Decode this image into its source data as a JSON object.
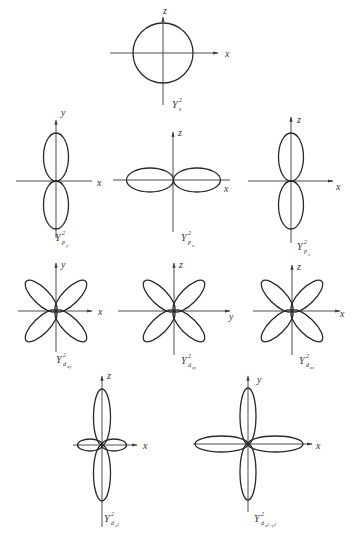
{
  "figure": {
    "panels": [
      {
        "id": "s",
        "axis_h": "x",
        "axis_v": "z",
        "label_main": "Y",
        "label_sup": "2",
        "label_sub": "s"
      },
      {
        "id": "py",
        "axis_h": "x",
        "axis_v": "y",
        "label_main": "Y",
        "label_sup": "2",
        "label_sub": "p_y"
      },
      {
        "id": "px",
        "axis_h": "x",
        "axis_v": "z",
        "label_main": "Y",
        "label_sup": "2",
        "label_sub": "p_x"
      },
      {
        "id": "pz",
        "axis_h": "x",
        "axis_v": "z",
        "label_main": "Y",
        "label_sup": "2",
        "label_sub": "p_z"
      },
      {
        "id": "dxy",
        "axis_h": "x",
        "axis_v": "y",
        "label_main": "Y",
        "label_sup": "2",
        "label_sub": "d_xy"
      },
      {
        "id": "dzy",
        "axis_h": "y",
        "axis_v": "z",
        "label_main": "Y",
        "label_sup": "2",
        "label_sub": "d_zy"
      },
      {
        "id": "dxz",
        "axis_h": "x",
        "axis_v": "z",
        "label_main": "Y",
        "label_sup": "2",
        "label_sub": "d_xz"
      },
      {
        "id": "dz2",
        "axis_h": "x",
        "axis_v": "z",
        "label_main": "Y",
        "label_sup": "2",
        "label_sub": "d_z²"
      },
      {
        "id": "dx2y2",
        "axis_h": "x",
        "axis_v": "y",
        "label_main": "Y",
        "label_sup": "2",
        "label_sub": "d_x²−y²"
      }
    ]
  },
  "labels": {
    "s": {
      "axis_h": "x",
      "axis_v": "z",
      "main": "Y",
      "sup": "2",
      "sub": "s"
    },
    "py": {
      "axis_h": "x",
      "axis_v": "y",
      "main": "Y",
      "sup": "2",
      "sub": "p",
      "subsub": "y"
    },
    "px": {
      "axis_h": "x",
      "axis_v": "z",
      "main": "Y",
      "sup": "2",
      "sub": "p",
      "subsub": "x"
    },
    "pz": {
      "axis_h": "x",
      "axis_v": "z",
      "main": "Y",
      "sup": "2",
      "sub": "p",
      "subsub": "z"
    },
    "dxy": {
      "axis_h": "x",
      "axis_v": "y",
      "main": "Y",
      "sup": "2",
      "sub": "d",
      "subsub": "xy"
    },
    "dzy": {
      "axis_h": "y",
      "axis_v": "z",
      "main": "Y",
      "sup": "2",
      "sub": "d",
      "subsub": "zy"
    },
    "dxz": {
      "axis_h": "x",
      "axis_v": "z",
      "main": "Y",
      "sup": "2",
      "sub": "d",
      "subsub": "xz"
    },
    "dz2": {
      "axis_h": "x",
      "axis_v": "z",
      "main": "Y",
      "sup": "2",
      "sub": "d",
      "subsub": "z²"
    },
    "dx2y2": {
      "axis_h": "x",
      "axis_v": "y",
      "main": "Y",
      "sup": "2",
      "sub": "d",
      "subsub": "x²−y²"
    }
  },
  "colors": {
    "line": "#2a2a2a",
    "background": "#ffffff"
  }
}
